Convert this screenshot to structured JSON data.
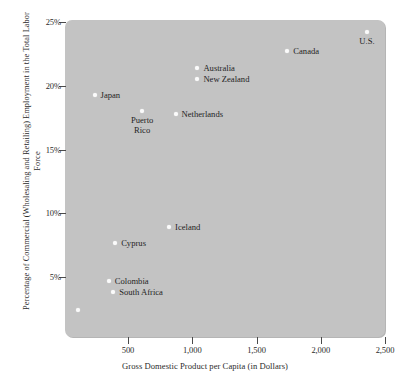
{
  "chart_data": {
    "type": "scatter",
    "title": "",
    "xlabel": "Gross Domestic Product per Capita (in Dollars)",
    "ylabel": "Percentage of Commercial (Wholesaling and Retailing) Employment in the Total Labor Force",
    "xlim": [
      0,
      2500
    ],
    "ylim": [
      1.5,
      25
    ],
    "grid": false,
    "legend": "none",
    "xticks": [
      {
        "value": 500,
        "label": "500"
      },
      {
        "value": 1000,
        "label": "1,000"
      },
      {
        "value": 1500,
        "label": "1,500"
      },
      {
        "value": 2000,
        "label": "2,000"
      },
      {
        "value": 2500,
        "label": "2,500"
      }
    ],
    "yticks": [
      {
        "value": 25,
        "label": "25%"
      },
      {
        "value": 20,
        "label": "20%"
      },
      {
        "value": 15,
        "label": "15%"
      },
      {
        "value": 10,
        "label": "10%"
      },
      {
        "value": 5,
        "label": "5%"
      }
    ],
    "points": [
      {
        "name": "U.S.",
        "x": 2360,
        "y": 24.2,
        "label": "U.S.",
        "label_pos": "below-center"
      },
      {
        "name": "Canada",
        "x": 1740,
        "y": 22.7,
        "label": "Canada",
        "label_pos": "right"
      },
      {
        "name": "Australia",
        "x": 1040,
        "y": 21.4,
        "label": "Australia",
        "label_pos": "right"
      },
      {
        "name": "New Zealand",
        "x": 1040,
        "y": 20.5,
        "label": "New Zealand",
        "label_pos": "right"
      },
      {
        "name": "Japan",
        "x": 240,
        "y": 19.3,
        "label": "Japan",
        "label_pos": "right"
      },
      {
        "name": "Puerto Rico",
        "x": 610,
        "y": 18.0,
        "label": "Puerto\nRico",
        "label_pos": "below-center"
      },
      {
        "name": "Netherlands",
        "x": 870,
        "y": 17.8,
        "label": "Netherlands",
        "label_pos": "right"
      },
      {
        "name": "Iceland",
        "x": 820,
        "y": 8.9,
        "label": "Iceland",
        "label_pos": "right"
      },
      {
        "name": "Cyprus",
        "x": 400,
        "y": 7.7,
        "label": "Cyprus",
        "label_pos": "right"
      },
      {
        "name": "Colombia",
        "x": 350,
        "y": 4.7,
        "label": "Colombia",
        "label_pos": "right"
      },
      {
        "name": "South Africa",
        "x": 385,
        "y": 3.8,
        "label": "South Africa",
        "label_pos": "right"
      },
      {
        "name": "unlabeled",
        "x": 110,
        "y": 2.4,
        "label": "",
        "label_pos": "none"
      }
    ]
  }
}
